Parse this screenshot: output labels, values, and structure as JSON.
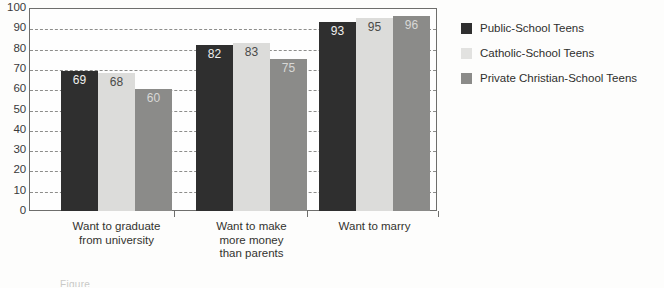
{
  "chart_data": {
    "type": "bar",
    "title": "",
    "xlabel": "",
    "ylabel": "",
    "ylim": [
      0,
      100
    ],
    "ytick_step": 10,
    "yticks": [
      100,
      90,
      80,
      70,
      60,
      50,
      40,
      30,
      20,
      10,
      0
    ],
    "grid": true,
    "grid_style": "dashed-horizontal",
    "legend_position": "right",
    "categories": [
      "Want to graduate from university",
      "Want to make more money than parents",
      "Want to marry"
    ],
    "category_lines": [
      [
        "Want to graduate",
        "from university"
      ],
      [
        "Want to make",
        "more money",
        "than parents"
      ],
      [
        "Want to marry"
      ]
    ],
    "series": [
      {
        "name": "Public-School Teens",
        "color": "#2f2f2f",
        "values": [
          69,
          82,
          93
        ]
      },
      {
        "name": "Catholic-School Teens",
        "color": "#dcdcda",
        "values": [
          68,
          83,
          95
        ]
      },
      {
        "name": "Private Christian-School Teens",
        "color": "#8b8b89",
        "values": [
          60,
          75,
          96
        ]
      }
    ]
  },
  "legend": {
    "items": [
      {
        "label": "Public-School Teens"
      },
      {
        "label": "Catholic-School Teens"
      },
      {
        "label": "Private Christian-School Teens"
      }
    ]
  },
  "caption_sliver": "Figure"
}
